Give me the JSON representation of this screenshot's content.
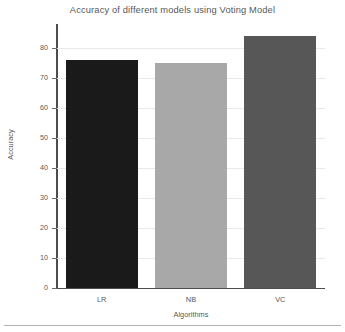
{
  "chart_data": {
    "type": "bar",
    "title": "Accuracy of different models using Voting Model",
    "xlabel": "Algorithms",
    "ylabel": "Accuracy",
    "categories": [
      "LR",
      "NB",
      "VC"
    ],
    "values": [
      76,
      75,
      84
    ],
    "colors": [
      "#1a1a1a",
      "#a8a8a8",
      "#575757"
    ],
    "ylim": [
      0,
      88
    ],
    "yticks": [
      0,
      10,
      20,
      30,
      40,
      50,
      60,
      70,
      80
    ],
    "ytick_labels": [
      "0",
      "10",
      "20",
      "30",
      "40",
      "50",
      "60",
      "70",
      "80"
    ],
    "grid": true,
    "legend": false
  }
}
